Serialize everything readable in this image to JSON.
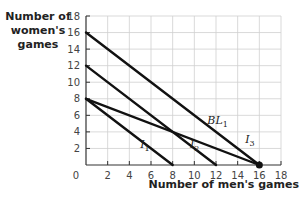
{
  "chart_data": {
    "type": "line",
    "title": "",
    "xlabel": "Number of men's games",
    "ylabel": "Number of women's games",
    "xlim": [
      0,
      18
    ],
    "ylim": [
      0,
      18
    ],
    "xticks": [
      0,
      2,
      4,
      6,
      8,
      10,
      12,
      14,
      16,
      18
    ],
    "yticks": [
      2,
      4,
      6,
      8,
      10,
      12,
      14,
      16,
      18
    ],
    "grid": true,
    "series": [
      {
        "name": "I1",
        "label_main": "I",
        "label_sub": "1",
        "points": [
          [
            0,
            8
          ],
          [
            8,
            0
          ]
        ],
        "label_pos": [
          5,
          2
        ]
      },
      {
        "name": "I2",
        "label_main": "I",
        "label_sub": "2",
        "points": [
          [
            0,
            12
          ],
          [
            12,
            0
          ]
        ],
        "label_pos": [
          9.6,
          2
        ]
      },
      {
        "name": "I3",
        "label_main": "I",
        "label_sub": "3",
        "points": [
          [
            0,
            16
          ],
          [
            16,
            0
          ]
        ],
        "label_pos": [
          14.7,
          2.6
        ]
      },
      {
        "name": "BL1",
        "label_main": "BL",
        "label_sub": "1",
        "points": [
          [
            0,
            8
          ],
          [
            16,
            0
          ]
        ],
        "label_pos": [
          11.2,
          5
        ]
      }
    ],
    "annotations": [
      {
        "type": "point",
        "x": 16,
        "y": 0,
        "description": "tangency/endpoint dot"
      }
    ]
  },
  "colors": {
    "line": "#111111",
    "grid": "#cfcfcf",
    "axis": "#333333",
    "tick_text": "#444444"
  }
}
